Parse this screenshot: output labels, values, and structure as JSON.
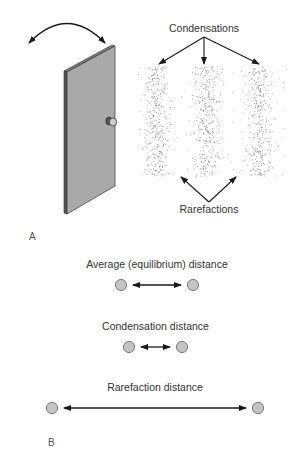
{
  "colors": {
    "line": "#1a1a1a",
    "door_face": "#a9a9a9",
    "door_edge": "#555555",
    "door_top": "#7a7a7a",
    "particle_fill": "#c4c4c4",
    "particle_stroke": "#6e6e6e",
    "stipple": "#6a6a6a",
    "text": "#333333"
  },
  "panel_a": {
    "label": "A",
    "condensations_label": "Condensations",
    "rarefactions_label": "Rarefactions",
    "door": {
      "icon": "door-swinging-icon"
    },
    "swing_arrow": {
      "icon": "double-headed-curved-arrow-icon"
    },
    "stipple": {
      "x_min": 138,
      "x_max": 286,
      "y_min": 66,
      "y_max": 176,
      "band_centers": [
        156,
        207,
        259
      ],
      "band_sigma": 9,
      "dense_count": 330,
      "sparse_count": 140
    }
  },
  "panel_b": {
    "label": "B",
    "rows": [
      {
        "label": "Average (equilibrium) distance",
        "left_x": 121,
        "right_x": 193,
        "y": 285,
        "label_y": 268
      },
      {
        "label": "Condensation distance",
        "left_x": 129,
        "right_x": 182,
        "y": 347,
        "label_y": 330
      },
      {
        "label": "Rarefaction distance",
        "left_x": 52,
        "right_x": 258,
        "y": 408,
        "label_y": 391
      }
    ]
  }
}
